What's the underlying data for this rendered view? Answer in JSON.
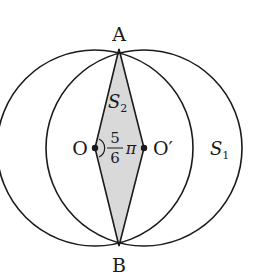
{
  "diagram": {
    "type": "geometry-two-intersecting-circles",
    "colors": {
      "stroke": "#1a1a1a",
      "shade": "#d9d9d9",
      "background": "#ffffff"
    },
    "points": {
      "A": {
        "label": "A",
        "x": 119,
        "y": 49
      },
      "B": {
        "label": "B",
        "x": 119,
        "y": 246
      },
      "O": {
        "label": "O",
        "x": 95,
        "y": 148
      },
      "O_prime": {
        "label": "O′",
        "x": 144,
        "y": 148
      }
    },
    "circles": [
      {
        "center": "O",
        "radius": 98
      },
      {
        "center": "O_prime",
        "radius": 98
      }
    ],
    "regions": {
      "S1": {
        "label": "S",
        "sub": "1"
      },
      "S2": {
        "label": "S",
        "sub": "2"
      }
    },
    "angle": {
      "numerator": "5",
      "denominator": "6",
      "symbol": "π"
    }
  }
}
